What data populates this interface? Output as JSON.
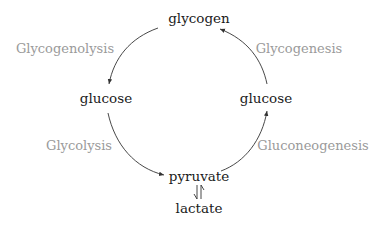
{
  "diagram": {
    "type": "metabolic-cycle",
    "nodes": {
      "top": "glycogen",
      "left": "glucose",
      "right": "glucose",
      "bottom": "pyruvate",
      "below_bottom": "lactate"
    },
    "processes": {
      "top_left": "Glycogenolysis",
      "top_right": "Glycogenesis",
      "bottom_left": "Glycolysis",
      "bottom_right": "Gluconeogenesis"
    },
    "edges": [
      {
        "from": "glycogen",
        "to": "glucose (left)",
        "label": "Glycogenolysis"
      },
      {
        "from": "glucose (left)",
        "to": "pyruvate",
        "label": "Glycolysis"
      },
      {
        "from": "pyruvate",
        "to": "glucose (right)",
        "label": "Gluconeogenesis"
      },
      {
        "from": "glucose (right)",
        "to": "glycogen",
        "label": "Glycogenesis"
      },
      {
        "from": "pyruvate",
        "to": "lactate",
        "label": "",
        "reversible": true
      }
    ],
    "colors": {
      "node_text": "#1a1a1a",
      "process_text": "#9a9a9a",
      "arrows": "#333333"
    }
  }
}
